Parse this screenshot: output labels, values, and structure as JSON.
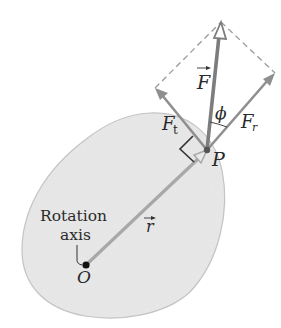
{
  "diagram": {
    "type": "torque-force-decomposition",
    "labels": {
      "force": "F",
      "radial_component": "F",
      "radial_subscript": "r",
      "tangential_component": "F",
      "tangential_subscript": "t",
      "angle": "ϕ",
      "point": "P",
      "origin": "O",
      "position_vector": "r",
      "rotation_axis_line1": "Rotation",
      "rotation_axis_line2": "axis"
    },
    "colors": {
      "body_fill": "#e9e9e9",
      "body_outline": "#c4c4c4",
      "vector": "#8a8a8a",
      "force_vector": "#7d7d7d",
      "dashed": "#9a9a9a",
      "text": "#2a2a2a"
    }
  }
}
